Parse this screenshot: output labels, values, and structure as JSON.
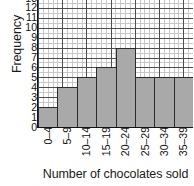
{
  "chart_data": {
    "type": "bar",
    "title": "",
    "xlabel": "Number of chocolates sold",
    "ylabel": "Frequency",
    "categories": [
      "0–4",
      "5–9",
      "10–14",
      "15–19",
      "20–24",
      "25–29",
      "30–34",
      "35–39"
    ],
    "values": [
      2,
      4,
      5,
      6,
      8,
      5,
      5,
      5
    ],
    "ylim": [
      0,
      13
    ],
    "ytick_labels": [
      "0",
      "1",
      "2",
      "3",
      "4",
      "5",
      "6",
      "7",
      "8",
      "9",
      "10",
      "11",
      "12",
      "13"
    ],
    "grid": true,
    "minor_grid": true,
    "legend": "none",
    "bar_color": "#a9a9a9",
    "bar_edge_color": "#2b2b2b",
    "axis_color": "#141414",
    "grid_major_color": "#3a3a3a",
    "grid_minor_color": "#9a9a9a",
    "background_color": "#ffffff"
  }
}
